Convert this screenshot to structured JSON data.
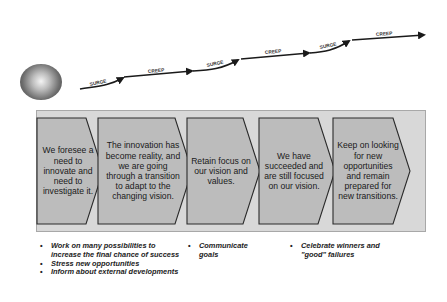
{
  "progress_arrow": {
    "segments": [
      {
        "label": "SURGE",
        "type": "surge"
      },
      {
        "label": "CREEP",
        "type": "creep"
      },
      {
        "label": "SURGE",
        "type": "surge"
      },
      {
        "label": "CREEP",
        "type": "creep"
      },
      {
        "label": "SURGE",
        "type": "surge"
      },
      {
        "label": "CREEP",
        "type": "creep"
      }
    ]
  },
  "stages": [
    {
      "text": "We foresee a need to innovate and need to investigate it."
    },
    {
      "text": "The innovation has become reality, and we are going through a transition to adapt to the changing vision."
    },
    {
      "text": "Retain focus on our vision and values."
    },
    {
      "text": "We have succeeded and are still focused on our vision."
    },
    {
      "text": "Keep on looking for new opportunities and remain prepared for new transitions."
    }
  ],
  "actions": {
    "col1": [
      "Work on many possibilities to increase the final chance of success",
      "Stress new opportunities",
      "Inform about external developments"
    ],
    "col2": [
      "Communicate goals"
    ],
    "col3": [
      "Celebrate winners and \"good\" failures"
    ]
  },
  "colors": {
    "panel": "#d8d8d8",
    "chevron_fill": "#bcbcbc",
    "chevron_stroke": "#2a2a2a",
    "arrow": "#1a1a1a"
  }
}
